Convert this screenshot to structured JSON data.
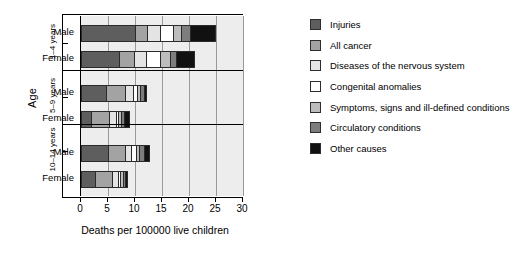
{
  "chart_data": {
    "type": "bar",
    "orientation": "horizontal",
    "stacked": true,
    "title": "",
    "xlabel": "Deaths per 100000 live children",
    "ylabel": "Age",
    "xlim": [
      0,
      30
    ],
    "xticks": [
      0,
      5,
      10,
      15,
      20,
      25,
      30
    ],
    "xticklabels": [
      "0",
      "5",
      "10",
      "15",
      "20",
      "25",
      "30"
    ],
    "grid": "vertical",
    "legend_position": "right",
    "group_labels": [
      "1–4 years",
      "5–9 years",
      "10–14 years"
    ],
    "categories": [
      "1-4 years Male",
      "1-4 years Female",
      "5-9 years Male",
      "5-9 years Female",
      "10-14 years Male",
      "10-14 years Female"
    ],
    "category_labels": [
      "Male",
      "Female",
      "Male",
      "Female",
      "Male",
      "Female"
    ],
    "series": [
      {
        "name": "Injuries",
        "color": "#5e5e5e",
        "values": [
          10.2,
          7.2,
          4.8,
          2.0,
          5.2,
          2.8
        ]
      },
      {
        "name": "All cancer",
        "color": "#a3a3a3",
        "values": [
          2.3,
          2.8,
          3.6,
          3.4,
          3.2,
          3.1
        ]
      },
      {
        "name": "Diseases of the nervous system",
        "color": "#e4e4e4",
        "values": [
          2.3,
          2.3,
          1.4,
          1.2,
          1.1,
          1.2
        ]
      },
      {
        "name": "Congenital anomalies",
        "color": "#ffffff",
        "values": [
          2.5,
          2.6,
          0.8,
          0.5,
          0.8,
          0.3
        ]
      },
      {
        "name": "Symptoms, signs and ill-defined conditions",
        "color": "#bcbcbc",
        "values": [
          1.5,
          1.7,
          0.6,
          0.5,
          0.6,
          0.5
        ]
      },
      {
        "name": "Circulatory conditions",
        "color": "#7d7d7d",
        "values": [
          1.5,
          1.2,
          0.6,
          0.5,
          0.9,
          0.4
        ]
      },
      {
        "name": "Other causes",
        "color": "#111111",
        "values": [
          4.7,
          3.3,
          0.5,
          0.9,
          0.9,
          0.5
        ]
      }
    ],
    "totals": [
      25.0,
      21.1,
      12.3,
      9.0,
      12.7,
      8.8
    ]
  },
  "axes": {
    "y_title": "Age",
    "x_title": "Deaths per 100000 live children",
    "groups": [
      {
        "label": "1–4 years",
        "rows": [
          "Male",
          "Female"
        ]
      },
      {
        "label": "5–9 years",
        "rows": [
          "Male",
          "Female"
        ]
      },
      {
        "label": "10–14 years",
        "rows": [
          "Male",
          "Female"
        ]
      }
    ],
    "xticklabels": [
      "0",
      "5",
      "10",
      "15",
      "20",
      "25",
      "30"
    ]
  },
  "legend": {
    "items": [
      {
        "label": "Injuries",
        "color": "#5e5e5e"
      },
      {
        "label": "All cancer",
        "color": "#a3a3a3"
      },
      {
        "label": "Diseases of the nervous system",
        "color": "#e4e4e4"
      },
      {
        "label": "Congenital anomalies",
        "color": "#ffffff"
      },
      {
        "label": "Symptoms, signs and ill-defined conditions",
        "color": "#bcbcbc"
      },
      {
        "label": "Circulatory conditions",
        "color": "#7d7d7d"
      },
      {
        "label": "Other causes",
        "color": "#111111"
      }
    ]
  }
}
